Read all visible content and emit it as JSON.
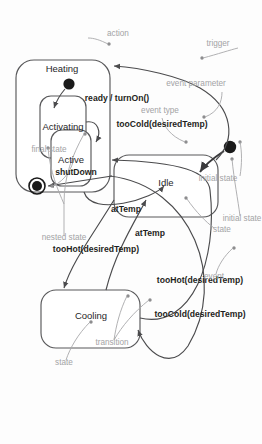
{
  "diagram": {
    "kind": "uml-state-machine",
    "background_color": "#fdfdfd",
    "line_color": "#4b4b4d",
    "annotation_color": "#a3a3a5",
    "label_color": "#1f1f21"
  },
  "states": {
    "idle": "Idle",
    "cooling": "Cooling",
    "heating": "Heating",
    "activating": "Activating",
    "active": "Active"
  },
  "pseudostates": {
    "initial": "initial-state-node",
    "nested_initial": "nested-initial-state-node",
    "final": "final-state-node"
  },
  "transitions": {
    "shut_down": "shutDown",
    "too_cold_top": "tooCold(desiredTemp)",
    "at_temp_upper": "atTemp",
    "at_temp_lower": "atTemp",
    "too_hot_bottom": "tooHot(desiredTemp)",
    "too_hot_right": "tooHot(desiredTemp)",
    "too_cold_right": "tooCold(desiredTemp)",
    "ready_turn_on": "ready / turnOn()"
  },
  "annotations": {
    "final_state": "final state",
    "event_parameter": "event parameter",
    "trigger": "trigger",
    "event_type": "event type",
    "initial_state_top": "initial state",
    "action": "action",
    "nested_state": "nested state",
    "state_left": "state",
    "initial_state_bottom": "initial state",
    "event": "event",
    "transition": "transition",
    "state_cooling": "state"
  }
}
